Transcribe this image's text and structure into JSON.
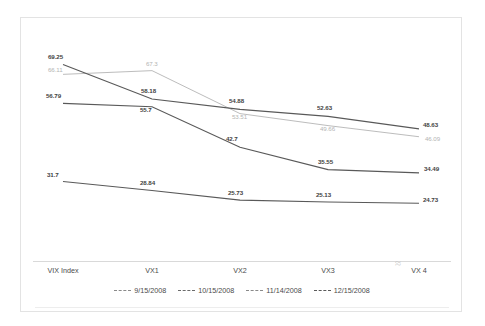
{
  "chart_data": {
    "type": "line",
    "title": "",
    "xlabel": "",
    "ylabel": "",
    "categories": [
      "VIX Index",
      "VX1",
      "VX2",
      "VX3",
      "VX 4"
    ],
    "ylim": [
      20,
      72
    ],
    "grid": false,
    "legend_position": "bottom",
    "series": [
      {
        "name": "9/15/2008",
        "color": "#b4b4b4",
        "values": [
          66.11,
          67.3,
          53.51,
          49.66,
          46.09
        ],
        "labels": [
          "66.11",
          "67.3",
          "53.51",
          "49.66",
          "46.09"
        ]
      },
      {
        "name": "10/15/2008",
        "color": "#595959",
        "values": [
          69.25,
          58.18,
          54.88,
          52.63,
          48.63
        ],
        "labels": [
          "69.25",
          "58.18",
          "54.88",
          "52.63",
          "48.63"
        ]
      },
      {
        "name": "11/14/2008",
        "color": "#595959",
        "values": [
          56.79,
          55.7,
          42.7,
          35.55,
          34.49
        ],
        "labels": [
          "56.79",
          "55.7",
          "42.7",
          "35.55",
          "34.49"
        ]
      },
      {
        "name": "12/15/2008",
        "color": "#595959",
        "values": [
          31.7,
          28.84,
          25.73,
          25.13,
          24.73
        ],
        "labels": [
          "31.7",
          "28.84",
          "25.73",
          "25.13",
          "24.73"
        ]
      }
    ]
  },
  "axis": {
    "ticks": [
      "VIX Index",
      "VX1",
      "VX2",
      "VX3",
      "VX 4"
    ],
    "break_marker": "≈"
  },
  "legend": {
    "items": [
      {
        "label": "9/15/2008",
        "color": "#8a8a8a"
      },
      {
        "label": "10/15/2008",
        "color": "#6b6b6b"
      },
      {
        "label": "11/14/2008",
        "color": "#8a8a8a"
      },
      {
        "label": "12/15/2008",
        "color": "#5a5a5a"
      }
    ]
  }
}
